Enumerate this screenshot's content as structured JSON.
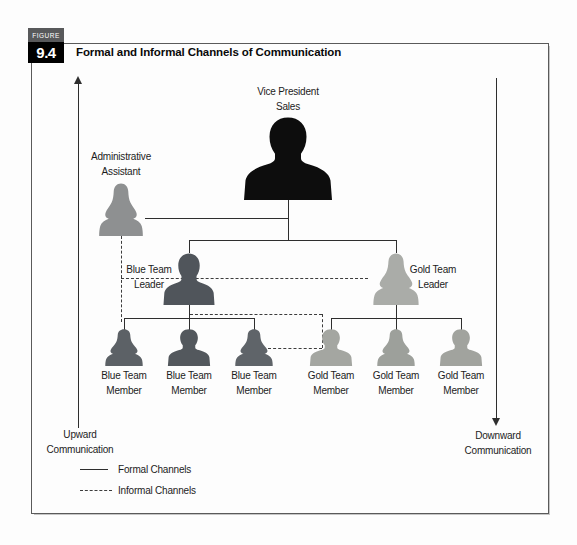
{
  "figure": {
    "eyebrow": "FIGURE",
    "number": "9.4",
    "title": "Formal and Informal Channels of Communication"
  },
  "flows": {
    "left": {
      "line1": "Upward",
      "line2": "Communication"
    },
    "right": {
      "line1": "Downward",
      "line2": "Communication"
    }
  },
  "legend": {
    "formal": "Formal Channels",
    "informal": "Informal Channels"
  },
  "colors": {
    "vp": "#0d0d0d",
    "admin": "#8e9091",
    "blue_leader": "#50555b",
    "gold_leader": "#aaaca8",
    "blue_member_1": "#5c6166",
    "blue_member_2": "#53585d",
    "blue_member_3": "#5f6469",
    "gold_member_1": "#a4a6a1",
    "gold_member_2": "#9da09b",
    "gold_member_3": "#a1a39e"
  },
  "nodes": {
    "vp": {
      "line1": "Vice President",
      "line2": "Sales"
    },
    "admin": {
      "line1": "Administrative",
      "line2": "Assistant"
    },
    "blue_leader": {
      "line1": "Blue Team",
      "line2": "Leader"
    },
    "gold_leader": {
      "line1": "Gold Team",
      "line2": "Leader"
    },
    "blue_member_1": {
      "line1": "Blue Team",
      "line2": "Member"
    },
    "blue_member_2": {
      "line1": "Blue Team",
      "line2": "Member"
    },
    "blue_member_3": {
      "line1": "Blue Team",
      "line2": "Member"
    },
    "gold_member_1": {
      "line1": "Gold Team",
      "line2": "Member"
    },
    "gold_member_2": {
      "line1": "Gold Team",
      "line2": "Member"
    },
    "gold_member_3": {
      "line1": "Gold Team",
      "line2": "Member"
    }
  }
}
